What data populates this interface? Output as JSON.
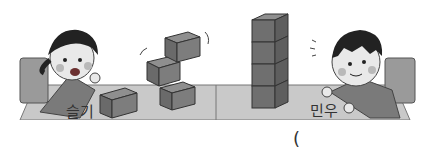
{
  "scene": {
    "description": "Two children stacking cubes on a table",
    "left_child": {
      "name": "슬기",
      "cubes": 4,
      "stack": "toppling"
    },
    "right_child": {
      "name": "민우",
      "cubes": 4,
      "stack": "straight tower"
    }
  },
  "answer": {
    "open_paren": "("
  }
}
